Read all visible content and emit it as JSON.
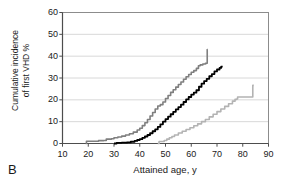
{
  "panel": {
    "letter": "B"
  },
  "chart_data": {
    "type": "line",
    "title": "",
    "subtitle": "",
    "xlabel": "Attained age, y",
    "ylabel": "Cumulative incidence of first VHD %",
    "ylabel_line1": "Cumulative incidence",
    "ylabel_line2": "of first VHD %",
    "xlim": [
      10,
      90
    ],
    "ylim": [
      0,
      60
    ],
    "xticks": [
      10,
      20,
      30,
      40,
      50,
      60,
      70,
      80,
      90
    ],
    "yticks": [
      0,
      10,
      20,
      30,
      40,
      50,
      60
    ],
    "xtick_labels": [
      "10",
      "20",
      "30",
      "40",
      "50",
      "60",
      "70",
      "80",
      "90"
    ],
    "ytick_labels": [
      "0",
      "10",
      "20",
      "30",
      "40",
      "50",
      "60"
    ],
    "grid": "horizontal",
    "legend": "none",
    "step_curves": true,
    "series": [
      {
        "name": "dark-gray-curve",
        "color": "#7f7f7f",
        "width": 1.6,
        "points": [
          [
            19.0,
            0.0
          ],
          [
            19.3,
            1.0
          ],
          [
            23.0,
            1.0
          ],
          [
            24.0,
            1.3
          ],
          [
            26.0,
            1.4
          ],
          [
            27.0,
            2.0
          ],
          [
            29.0,
            2.2
          ],
          [
            30.0,
            2.6
          ],
          [
            31.5,
            3.0
          ],
          [
            33.0,
            3.4
          ],
          [
            34.5,
            3.9
          ],
          [
            36.0,
            4.5
          ],
          [
            37.5,
            5.2
          ],
          [
            39.0,
            6.2
          ],
          [
            40.0,
            7.0
          ],
          [
            41.0,
            8.2
          ],
          [
            42.0,
            9.5
          ],
          [
            43.0,
            11.0
          ],
          [
            44.0,
            12.6
          ],
          [
            45.0,
            14.2
          ],
          [
            46.0,
            15.8
          ],
          [
            47.0,
            17.2
          ],
          [
            48.0,
            17.8
          ],
          [
            49.0,
            19.0
          ],
          [
            50.0,
            20.6
          ],
          [
            51.0,
            22.0
          ],
          [
            52.0,
            23.4
          ],
          [
            53.0,
            24.6
          ],
          [
            54.0,
            25.8
          ],
          [
            55.0,
            27.0
          ],
          [
            56.0,
            28.2
          ],
          [
            57.0,
            29.4
          ],
          [
            58.0,
            30.6
          ],
          [
            59.0,
            31.6
          ],
          [
            60.0,
            32.6
          ],
          [
            61.0,
            33.4
          ],
          [
            62.0,
            34.4
          ],
          [
            62.8,
            35.6
          ],
          [
            63.5,
            36.0
          ],
          [
            64.5,
            36.4
          ],
          [
            65.5,
            36.7
          ],
          [
            66.0,
            36.8
          ],
          [
            66.2,
            43.0
          ],
          [
            66.4,
            43.0
          ]
        ]
      },
      {
        "name": "black-curve",
        "color": "#000000",
        "width": 1.8,
        "points": [
          [
            30.0,
            0.0
          ],
          [
            31.0,
            0.3
          ],
          [
            33.0,
            0.4
          ],
          [
            35.0,
            0.5
          ],
          [
            36.5,
            0.8
          ],
          [
            38.0,
            1.2
          ],
          [
            39.0,
            1.6
          ],
          [
            40.0,
            2.0
          ],
          [
            41.0,
            2.6
          ],
          [
            42.0,
            3.2
          ],
          [
            43.0,
            3.9
          ],
          [
            44.0,
            4.7
          ],
          [
            45.0,
            5.6
          ],
          [
            46.0,
            6.5
          ],
          [
            47.0,
            7.6
          ],
          [
            48.0,
            8.8
          ],
          [
            49.0,
            10.0
          ],
          [
            50.0,
            11.2
          ],
          [
            51.0,
            12.3
          ],
          [
            52.0,
            13.4
          ],
          [
            53.0,
            14.5
          ],
          [
            54.0,
            15.6
          ],
          [
            55.0,
            16.7
          ],
          [
            56.0,
            17.8
          ],
          [
            57.0,
            19.0
          ],
          [
            58.0,
            20.2
          ],
          [
            59.0,
            21.3
          ],
          [
            60.0,
            22.4
          ],
          [
            61.0,
            23.3
          ],
          [
            62.0,
            24.4
          ],
          [
            63.0,
            26.0
          ],
          [
            64.0,
            27.4
          ],
          [
            65.0,
            28.6
          ],
          [
            66.0,
            29.6
          ],
          [
            67.0,
            30.8
          ],
          [
            68.0,
            31.8
          ],
          [
            69.0,
            33.0
          ],
          [
            70.0,
            33.9
          ],
          [
            71.0,
            34.6
          ],
          [
            71.6,
            35.2
          ],
          [
            72.2,
            35.2
          ]
        ]
      },
      {
        "name": "light-gray-curve",
        "color": "#b3b3b3",
        "width": 1.6,
        "points": [
          [
            47.0,
            0.0
          ],
          [
            47.5,
            0.9
          ],
          [
            49.0,
            0.9
          ],
          [
            49.5,
            1.4
          ],
          [
            50.5,
            2.0
          ],
          [
            51.5,
            2.6
          ],
          [
            52.5,
            3.2
          ],
          [
            53.5,
            3.9
          ],
          [
            55.0,
            4.8
          ],
          [
            56.5,
            5.6
          ],
          [
            58.0,
            6.4
          ],
          [
            59.5,
            7.2
          ],
          [
            61.0,
            8.1
          ],
          [
            62.5,
            9.0
          ],
          [
            64.0,
            10.0
          ],
          [
            65.5,
            11.0
          ],
          [
            67.0,
            12.2
          ],
          [
            68.5,
            13.4
          ],
          [
            70.0,
            14.6
          ],
          [
            71.5,
            15.8
          ],
          [
            73.0,
            17.0
          ],
          [
            74.5,
            18.2
          ],
          [
            76.0,
            19.4
          ],
          [
            77.0,
            20.2
          ],
          [
            77.6,
            20.4
          ],
          [
            78.0,
            21.3
          ],
          [
            83.6,
            21.3
          ],
          [
            83.9,
            26.6
          ],
          [
            84.3,
            26.6
          ]
        ]
      }
    ]
  }
}
